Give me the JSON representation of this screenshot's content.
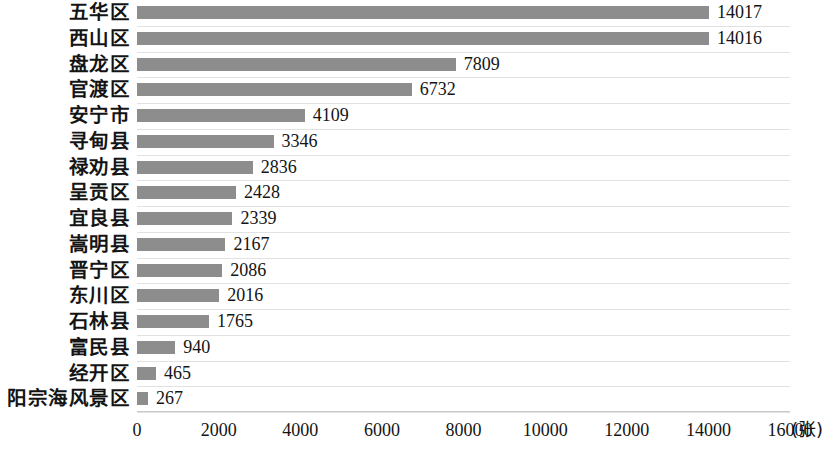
{
  "chart_data": {
    "type": "bar",
    "orientation": "horizontal",
    "title": "",
    "subtitle": "",
    "xlabel": "(张)",
    "ylabel": "",
    "xlim": [
      0,
      16000
    ],
    "xticks": [
      0,
      2000,
      4000,
      6000,
      8000,
      10000,
      12000,
      14000,
      16000
    ],
    "xtick_labels": [
      "0",
      "2000",
      "4000",
      "6000",
      "8000",
      "10000",
      "12000",
      "14000",
      "16000"
    ],
    "grid": "horizontal",
    "legend": null,
    "bar_color": "#8d8d8d",
    "categories": [
      "五华区",
      "西山区",
      "盘龙区",
      "官渡区",
      "安宁市",
      "寻甸县",
      "禄劝县",
      "呈贡区",
      "宜良县",
      "嵩明县",
      "晋宁区",
      "东川区",
      "石林县",
      "富民县",
      "经开区",
      "阳宗海风景区"
    ],
    "values": [
      14017,
      14016,
      7809,
      6732,
      4109,
      3346,
      2836,
      2428,
      2339,
      2167,
      2086,
      2016,
      1765,
      940,
      465,
      267
    ],
    "value_labels": [
      "14017",
      "14016",
      "7809",
      "6732",
      "4109",
      "3346",
      "2836",
      "2428",
      "2339",
      "2167",
      "2086",
      "2016",
      "1765",
      "940",
      "465",
      "267"
    ]
  }
}
